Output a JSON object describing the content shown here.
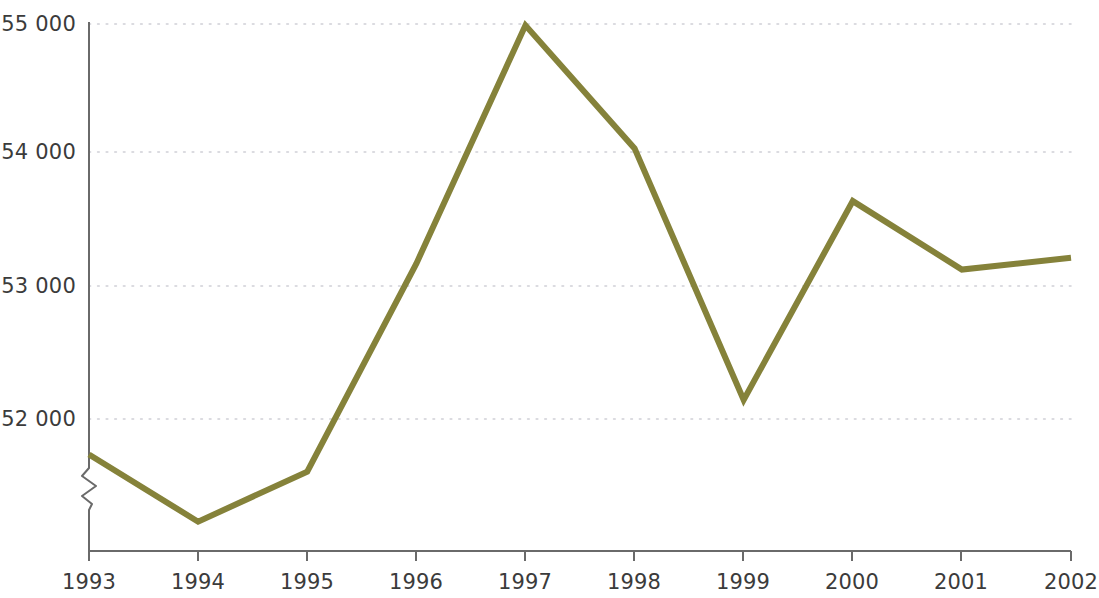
{
  "chart_data": {
    "type": "line",
    "title": "",
    "subtitle": "",
    "xlabel": "",
    "ylabel": "",
    "categories": [
      "1993",
      "1994",
      "1995",
      "1996",
      "1997",
      "1998",
      "1999",
      "2000",
      "2001",
      "2002"
    ],
    "values": [
      51730,
      51220,
      51600,
      53180,
      54990,
      54055,
      52145,
      53655,
      53135,
      53225
    ],
    "series": [
      {
        "name": "",
        "values": [
          51730,
          51220,
          51600,
          53180,
          54990,
          54055,
          52145,
          53655,
          53135,
          53225
        ],
        "color": "#85823a"
      }
    ],
    "ylim": [
      51000,
      55000
    ],
    "y_ticks": [
      52000,
      53000,
      54000,
      55000
    ],
    "y_tick_labels": [
      "52 000",
      "53 000",
      "54 000",
      "55 000"
    ],
    "x_tick_labels": [
      "1993",
      "1994",
      "1995",
      "1996",
      "1997",
      "1998",
      "1999",
      "2000",
      "2001",
      "2002"
    ],
    "grid": true,
    "grid_style": "dotted-horizontal",
    "grid_color": "#cfcfd6",
    "axis_color": "#6a6a6a",
    "axis_break": true,
    "axis_break_note": "zigzag break on y-axis below 52 000",
    "legend": "none",
    "legend_position": "none",
    "line_width_px": 6,
    "background": "#ffffff"
  },
  "axes": {
    "y_labels": [
      "55 000",
      "54 000",
      "53 000",
      "52 000"
    ],
    "x_labels": [
      "1993",
      "1994",
      "1995",
      "1996",
      "1997",
      "1998",
      "1999",
      "2000",
      "2001",
      "2002"
    ]
  }
}
